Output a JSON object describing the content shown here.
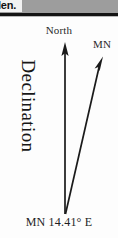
{
  "figure": {
    "type": "declination-diagram",
    "header": {
      "partial_text": "len.",
      "strip_color": "#9d9d9d",
      "rule_color": "#141414"
    },
    "labels": {
      "north": "North",
      "magnetic_north": "MN",
      "side_title": "Declination",
      "caption": "MN 14.41° E"
    },
    "arrows": [
      {
        "name": "true-north-arrow",
        "label": "North",
        "from": [
          65,
          214
        ],
        "to": [
          65,
          43
        ],
        "color": "#1a1a1a"
      },
      {
        "name": "magnetic-north-arrow",
        "label": "MN",
        "from": [
          65,
          214
        ],
        "to": [
          103,
          57
        ],
        "color": "#1a1a1a"
      }
    ],
    "declination_value": "14.41",
    "declination_unit": "°",
    "declination_direction": "E",
    "colors": {
      "background": "#fdfdfd",
      "ink": "#1a1a1a",
      "label_ink": "#2b2b2b"
    }
  }
}
